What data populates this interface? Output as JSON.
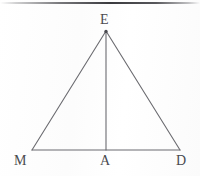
{
  "figure": {
    "type": "geometry-diagram",
    "shape": "triangle-with-altitude",
    "background_color": "#fdfdfd",
    "stroke_color": "#6b6b70",
    "label_color": "#4a4a50",
    "stroke_width": 1,
    "canvas": {
      "width": 200,
      "height": 176
    },
    "vertices": [
      {
        "id": "E",
        "label": "E",
        "x": 106,
        "y": 31,
        "role": "apex",
        "marker": "dot"
      },
      {
        "id": "M",
        "label": "M",
        "x": 32,
        "y": 150,
        "role": "base-left",
        "marker": "none"
      },
      {
        "id": "A",
        "label": "A",
        "x": 106,
        "y": 150,
        "role": "foot-of-altitude",
        "marker": "none"
      },
      {
        "id": "D",
        "label": "D",
        "x": 180,
        "y": 150,
        "role": "base-right",
        "marker": "none"
      }
    ],
    "segments": [
      {
        "id": "ME",
        "from": "M",
        "to": "E",
        "name": "left-side"
      },
      {
        "id": "ED",
        "from": "E",
        "to": "D",
        "name": "right-side"
      },
      {
        "id": "MD",
        "from": "M",
        "to": "D",
        "name": "base"
      },
      {
        "id": "EA",
        "from": "E",
        "to": "A",
        "name": "altitude"
      }
    ],
    "labels": {
      "apex": {
        "text": "E",
        "x": 100,
        "y": 13
      },
      "base_left": {
        "text": "M",
        "x": 14,
        "y": 154
      },
      "base_mid": {
        "text": "A",
        "x": 100,
        "y": 154
      },
      "base_right": {
        "text": "D",
        "x": 176,
        "y": 154
      }
    },
    "top_band": {
      "present": true,
      "color": "#303034",
      "y": 2,
      "height": 2
    }
  }
}
